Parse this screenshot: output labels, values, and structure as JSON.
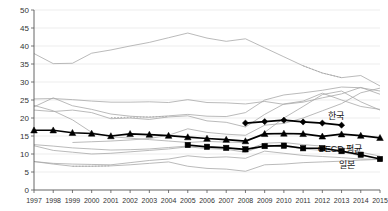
{
  "chart_data": {
    "type": "line",
    "title": "",
    "xlabel": "",
    "ylabel": "",
    "ylim": [
      0,
      50
    ],
    "ytick_step": 5,
    "grid": true,
    "legend_position": "inline-right",
    "x": [
      1997,
      1998,
      1999,
      2000,
      2001,
      2002,
      2003,
      2004,
      2005,
      2006,
      2007,
      2008,
      2009,
      2010,
      2011,
      2012,
      2013,
      2014,
      2015
    ],
    "xticklabels": [
      "1997",
      "1998",
      "1999",
      "2000",
      "2001",
      "2002",
      "2003",
      "2004",
      "2005",
      "2006",
      "2007",
      "2008",
      "2009",
      "2010",
      "2011",
      "2012",
      "2013",
      "2014",
      "2015"
    ],
    "yticklabels": [
      "0",
      "5",
      "10",
      "15",
      "20",
      "25",
      "30",
      "35",
      "40",
      "45",
      "50"
    ],
    "yticks": [
      0,
      5,
      10,
      15,
      20,
      25,
      30,
      35,
      40,
      45,
      50
    ],
    "highlighted_series": [
      {
        "name": "한국",
        "marker": "diamond",
        "color": "#000000",
        "label": "한국",
        "x": [
          2008,
          2009,
          2010,
          2011,
          2012,
          2013
        ],
        "values": [
          18.6,
          19.0,
          19.4,
          18.9,
          18.6,
          18.0
        ]
      },
      {
        "name": "OECD 평균",
        "marker": "triangle",
        "color": "#000000",
        "label": "OECD 평균",
        "x": [
          1997,
          1998,
          1999,
          2000,
          2001,
          2002,
          2003,
          2004,
          2005,
          2006,
          2007,
          2008,
          2009,
          2010,
          2011,
          2012,
          2013,
          2014,
          2015
        ],
        "values": [
          16.6,
          16.6,
          15.9,
          15.7,
          15.0,
          15.6,
          15.4,
          15.1,
          14.7,
          14.3,
          14.0,
          13.6,
          15.6,
          15.7,
          15.6,
          14.9,
          15.5,
          15.1,
          14.5
        ]
      },
      {
        "name": "일본",
        "marker": "square",
        "color": "#000000",
        "label": "일본",
        "x": [
          2005,
          2006,
          2007,
          2008,
          2009,
          2010,
          2011,
          2012,
          2013,
          2014,
          2015
        ],
        "values": [
          12.5,
          12.0,
          11.7,
          11.3,
          12.2,
          12.3,
          11.6,
          11.6,
          10.8,
          9.8,
          8.6
        ]
      }
    ],
    "background_series": [
      {
        "name": "bg-top",
        "style": "solid",
        "x": [
          1997,
          1998,
          1999,
          2000,
          2001,
          2002,
          2003,
          2004,
          2005,
          2006,
          2007,
          2008,
          2009,
          2010,
          2011,
          2012,
          2013,
          2014,
          2015
        ],
        "values": [
          37.9,
          35.1,
          35.2,
          38.0,
          38.9,
          40.0,
          41.0,
          42.3,
          43.6,
          42.2,
          41.3,
          42.0,
          39.5,
          37.0,
          34.5,
          32.5,
          31.2,
          31.8,
          28.9
        ]
      },
      {
        "name": "bg-top-dotted",
        "style": "dotted",
        "x": [
          2011,
          2012,
          2013
        ],
        "values": [
          34.5,
          32.5,
          31.2
        ]
      },
      {
        "name": "bg-2",
        "style": "solid",
        "x": [
          1997,
          1998,
          1999,
          2000,
          2001,
          2002,
          2003,
          2004,
          2005,
          2006,
          2007,
          2008,
          2009,
          2010,
          2011,
          2012,
          2013,
          2014,
          2015
        ],
        "values": [
          25.3,
          25.4,
          25.1,
          24.7,
          24.4,
          24.4,
          24.5,
          24.3,
          25.1,
          24.3,
          24.2,
          23.9,
          24.6,
          23.8,
          24.4,
          25.6,
          26.7,
          28.5,
          26.6
        ]
      },
      {
        "name": "bg-3",
        "style": "solid",
        "x": [
          1997,
          1998,
          1999,
          2000,
          2001,
          2002,
          2003,
          2004,
          2005,
          2006,
          2007,
          2008,
          2009,
          2010,
          2011,
          2012,
          2013,
          2014,
          2015
        ],
        "values": [
          23.1,
          25.6,
          23.4,
          22.4,
          21.1,
          20.5,
          20.2,
          20.6,
          21.0,
          20.5,
          20.4,
          21.5,
          25.0,
          26.4,
          27.0,
          27.7,
          28.6,
          28.4,
          27.5
        ]
      },
      {
        "name": "bg-4",
        "style": "solid",
        "x": [
          1997,
          1998,
          1999,
          2000,
          2001,
          2002,
          2003,
          2004,
          2005,
          2006,
          2007,
          2008,
          2009,
          2010,
          2011,
          2012,
          2013,
          2014,
          2015
        ],
        "values": [
          22.2,
          21.8,
          22.2,
          21.5,
          19.8,
          20.0,
          19.6,
          20.3,
          20.6,
          19.2,
          18.8,
          17.5,
          21.0,
          23.9,
          24.7,
          26.9,
          25.0,
          23.2,
          22.4
        ]
      },
      {
        "name": "bg-4-dotted",
        "style": "dotted",
        "x": [
          2001,
          2002,
          2003,
          2004
        ],
        "values": [
          20.1,
          20.2,
          20.3,
          20.4
        ]
      },
      {
        "name": "bg-5",
        "style": "solid",
        "x": [
          1997,
          1998,
          1999,
          2000,
          2001,
          2002,
          2003,
          2004,
          2005,
          2006,
          2007,
          2008,
          2009,
          2010,
          2011,
          2012,
          2013,
          2014,
          2015
        ],
        "values": [
          23.5,
          22.0,
          19.5,
          16.0,
          14.8,
          14.4,
          14.0,
          13.6,
          13.2,
          13.5,
          13.3,
          13.2,
          16.0,
          20.0,
          23.2,
          26.5,
          27.5,
          24.5,
          22.2
        ]
      },
      {
        "name": "bg-6",
        "style": "solid",
        "x": [
          1999,
          2000,
          2001,
          2002,
          2003,
          2004,
          2005,
          2006,
          2007,
          2008,
          2009,
          2010,
          2011,
          2012,
          2013,
          2014,
          2015
        ],
        "values": [
          13.2,
          13.4,
          13.6,
          13.9,
          14.3,
          15.2,
          17.0,
          16.0,
          15.5,
          15.2,
          18.0,
          18.5,
          20.0,
          22.0,
          24.0,
          27.0,
          28.3
        ]
      },
      {
        "name": "bg-7",
        "style": "solid",
        "x": [
          1997,
          1998,
          1999,
          2000,
          2001,
          2002,
          2003,
          2004,
          2005,
          2006,
          2007,
          2008,
          2009,
          2010,
          2011,
          2012,
          2013,
          2014,
          2015
        ],
        "values": [
          12.6,
          12.2,
          11.7,
          11.4,
          11.1,
          11.2,
          11.4,
          11.8,
          12.2,
          12.0,
          11.8,
          11.0,
          13.0,
          13.2,
          12.6,
          12.2,
          11.8,
          10.5,
          9.4
        ]
      },
      {
        "name": "bg-8",
        "style": "solid",
        "x": [
          1997,
          1998,
          1999,
          2000,
          2001,
          2002,
          2003,
          2004,
          2005,
          2006,
          2007,
          2008,
          2009,
          2010,
          2011,
          2012,
          2013,
          2014,
          2015
        ],
        "values": [
          12.3,
          11.0,
          10.5,
          10.0,
          10.2,
          10.6,
          11.0,
          11.4,
          12.0,
          11.5,
          11.3,
          10.5,
          12.5,
          12.2,
          11.4,
          11.0,
          10.6,
          9.5,
          8.8
        ]
      },
      {
        "name": "bg-9",
        "style": "solid",
        "x": [
          1997,
          1998,
          1999,
          2000,
          2001,
          2002,
          2003,
          2004,
          2005,
          2006,
          2007,
          2008,
          2009,
          2010,
          2011,
          2012,
          2013,
          2014,
          2015
        ],
        "values": [
          7.9,
          7.4,
          7.2,
          7.1,
          7.0,
          7.6,
          8.2,
          8.6,
          9.5,
          9.0,
          9.2,
          8.8,
          10.8,
          10.2,
          9.6,
          9.3,
          9.0,
          8.6,
          8.5
        ]
      },
      {
        "name": "bg-9-dotted",
        "style": "dotted",
        "x": [
          1999,
          2000,
          2001
        ],
        "values": [
          6.6,
          6.6,
          6.7
        ]
      },
      {
        "name": "bg-10",
        "style": "solid",
        "x": [
          1997,
          1998,
          1999,
          2000,
          2001,
          2002,
          2003,
          2004,
          2005,
          2006,
          2007,
          2008,
          2009,
          2010,
          2011,
          2012,
          2013,
          2014,
          2015
        ],
        "values": [
          7.9,
          7.2,
          6.6,
          6.6,
          6.7,
          7.0,
          7.4,
          7.8,
          6.6,
          6.0,
          5.8,
          5.2,
          7.0,
          7.2,
          7.6,
          7.8,
          8.0,
          8.3,
          8.5
        ]
      }
    ]
  }
}
